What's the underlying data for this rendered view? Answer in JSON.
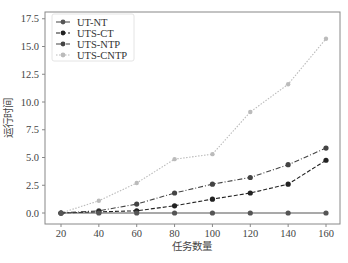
{
  "chart_data": {
    "type": "line",
    "title": "",
    "xlabel": "任务数量",
    "ylabel": "运行时间",
    "x": [
      20,
      40,
      60,
      80,
      100,
      120,
      140,
      160
    ],
    "xticks": [
      "20",
      "40",
      "60",
      "80",
      "100",
      "120",
      "140",
      "160"
    ],
    "yticks": [
      "0.0",
      "2.5",
      "5.0",
      "7.5",
      "10.0",
      "12.5",
      "15.0",
      "17.5"
    ],
    "xlim": [
      14,
      166
    ],
    "ylim": [
      -1.0,
      17.9
    ],
    "grid": false,
    "legend_position": "upper left",
    "series": [
      {
        "name": "UT-NT",
        "values": [
          0.0,
          0.0,
          0.0,
          0.0,
          0.0,
          0.0,
          0.0,
          0.0
        ],
        "color": "#555555",
        "linestyle": "solid",
        "marker": "circle"
      },
      {
        "name": "UTS-CT",
        "values": [
          0.0,
          0.1,
          0.2,
          0.65,
          1.25,
          1.8,
          2.6,
          4.75
        ],
        "color": "#222222",
        "linestyle": "dashed",
        "marker": "circle"
      },
      {
        "name": "UTS-NTP",
        "values": [
          0.0,
          0.2,
          0.8,
          1.8,
          2.6,
          3.2,
          4.35,
          5.85
        ],
        "color": "#444444",
        "linestyle": "dashdot",
        "marker": "circle"
      },
      {
        "name": "UTS-CNTP",
        "values": [
          0.0,
          1.1,
          2.7,
          4.85,
          5.3,
          9.1,
          11.6,
          15.7
        ],
        "color": "#bbbbbb",
        "linestyle": "dotted",
        "marker": "circle"
      }
    ]
  }
}
